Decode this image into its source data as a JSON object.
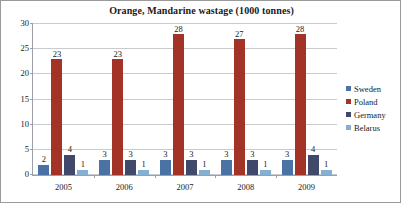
{
  "chart_data": {
    "type": "bar",
    "title": "Orange, Mandarine wastage (1000 tonnes)",
    "xlabel": "",
    "ylabel": "",
    "categories": [
      "2005",
      "2006",
      "2007",
      "2008",
      "2009"
    ],
    "series": [
      {
        "name": "Sweden",
        "color": "#4a72a4",
        "values": [
          2,
          3,
          3,
          3,
          3
        ]
      },
      {
        "name": "Poland",
        "color": "#a33227",
        "values": [
          23,
          23,
          28,
          27,
          28
        ]
      },
      {
        "name": "Germany",
        "color": "#41496a",
        "values": [
          4,
          3,
          3,
          3,
          4
        ]
      },
      {
        "name": "Belarus",
        "color": "#83b0d3",
        "values": [
          1,
          1,
          1,
          1,
          1
        ]
      }
    ],
    "ylim": [
      0,
      30
    ],
    "yticks": [
      "0",
      "5",
      "10",
      "15",
      "20",
      "25",
      "30"
    ],
    "grid": true,
    "legend_position": "right",
    "data_labels": true
  }
}
